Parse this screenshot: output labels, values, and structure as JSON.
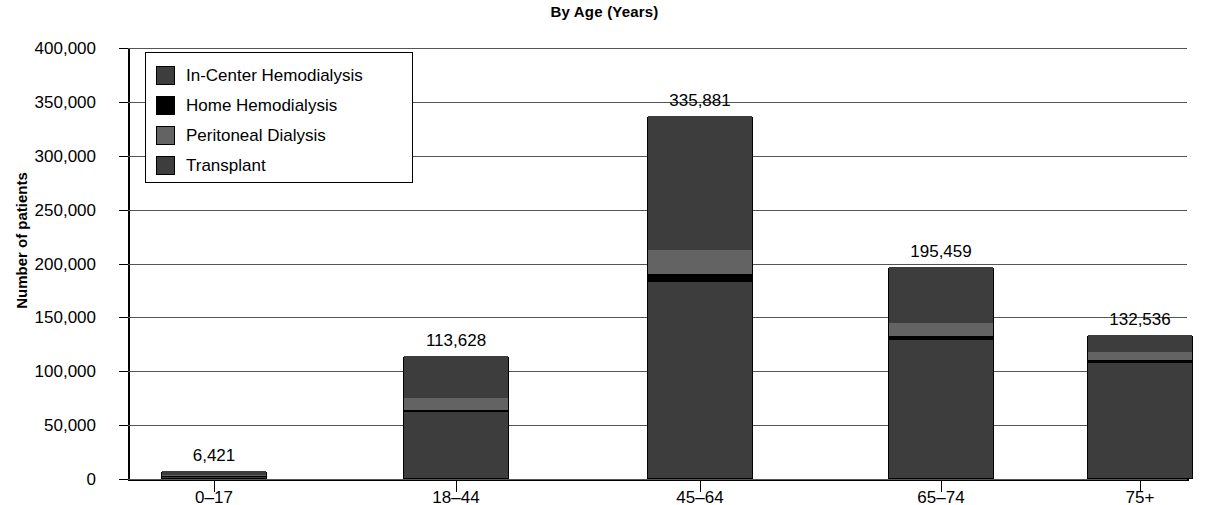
{
  "chart_data": {
    "type": "bar",
    "subtype": "stacked-bar",
    "title": "By Age (Years)",
    "xlabel": "",
    "ylabel": "Number of patients",
    "categories": [
      "0–17",
      "18–44",
      "45–64",
      "65–74",
      "75+"
    ],
    "totals": [
      6421,
      113628,
      335881,
      195459,
      132536
    ],
    "total_labels": [
      "6,421",
      "113,628",
      "335,881",
      "195,459",
      "132,536"
    ],
    "series": [
      {
        "name": "In-Center Hemodialysis",
        "color": "#3d3d3d",
        "values": [
          1900,
          61000,
          182000,
          128000,
          107000
        ]
      },
      {
        "name": "Home Hemodialysis",
        "color": "#000000",
        "values": [
          200,
          2500,
          7000,
          4000,
          2500
        ]
      },
      {
        "name": "Peritoneal Dialysis",
        "color": "#636363",
        "values": [
          700,
          11000,
          23000,
          12000,
          7000
        ]
      },
      {
        "name": "Transplant",
        "color": "#3d3d3d",
        "values": [
          3621,
          39128,
          123881,
          51459,
          16036
        ]
      }
    ],
    "ylim": [
      0,
      400000
    ],
    "y_ticks": [
      0,
      50000,
      100000,
      150000,
      200000,
      250000,
      300000,
      350000,
      400000
    ],
    "y_tick_labels": [
      "0",
      "50,000",
      "100,000",
      "150,000",
      "200,000",
      "250,000",
      "300,000",
      "350,000",
      "400,000"
    ],
    "grid": true,
    "grid_axis": "y",
    "legend_position": "top-left",
    "stack_order_bottom_to_top": [
      "In-Center Hemodialysis",
      "Home Hemodialysis",
      "Peritoneal Dialysis",
      "Transplant"
    ]
  },
  "legend": {
    "items": [
      {
        "label": "In-Center Hemodialysis",
        "color": "#3d3d3d"
      },
      {
        "label": "Home Hemodialysis",
        "color": "#000000"
      },
      {
        "label": "Peritoneal Dialysis",
        "color": "#636363"
      },
      {
        "label": "Transplant",
        "color": "#3d3d3d"
      }
    ]
  }
}
